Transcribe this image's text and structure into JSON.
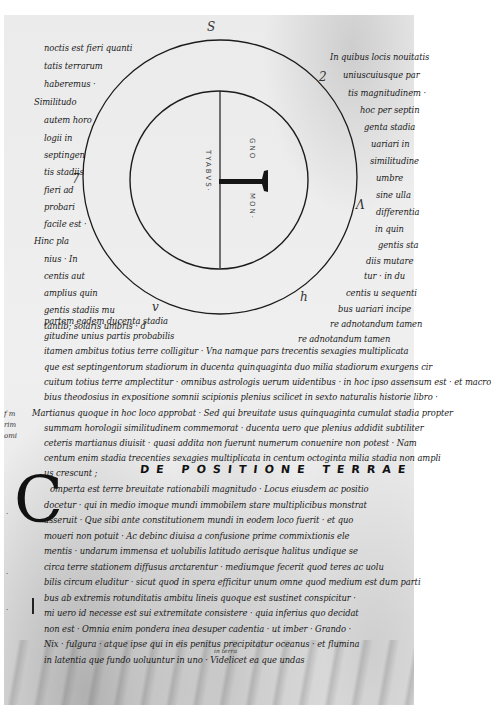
{
  "document": {
    "type": "medieval manuscript leaf",
    "subject": "De positione terrae",
    "colors": {
      "parchment": "#ececec",
      "ink": "#1a1a1a",
      "margin": "#ffffff"
    }
  },
  "diagram": {
    "outer_circle": {
      "cx": 220,
      "cy": 177,
      "r": 137
    },
    "inner_circle": {
      "cx": 219,
      "cy": 180,
      "r": 89
    },
    "vertical_line": {
      "x": 220,
      "y1": 91,
      "y2": 268
    },
    "t_bar": {
      "x1": 220,
      "x2": 266,
      "y": 181
    },
    "labels": {
      "left_vertical": "TYABVS·",
      "right_upper": "GNO",
      "right_lower": "MON·"
    },
    "quadrant_marks": [
      "S",
      "2",
      "7",
      "Λ",
      "h",
      "v",
      "d"
    ]
  },
  "left_column": [
    "noctis est fieri quanti",
    "tatis terrarum",
    "haberemus ·",
    "Similitudo",
    "autem horo",
    "logii in",
    "septingen",
    "tis stadiis",
    "fieri ad",
    "probari",
    "facile est ·",
    "Hinc pla",
    "nius · In",
    "centis aut",
    "amplius quin",
    "gentis stadiis mu",
    "tantib; solaris umbris · d"
  ],
  "right_column": [
    "In quibus locis nouitatis",
    "uniuscuiusque par",
    "tis magnitudinem ·",
    "hoc per septin",
    "genta stadia",
    "uariari in",
    "similitudine",
    "umbre",
    "sine ulla",
    "differentia",
    "in quin",
    "gentis sta",
    "diis mutare",
    "tur · in du",
    "centis u sequenti",
    "bus uariari incipe",
    "re adnotandum tamen"
  ],
  "full_lines": [
    "partem eadem ducenta stadia",
    "gitudine unius partis probabilis",
    "itamen ambitus totius terre colligitur · Vna namque pars trecentis sexagies multiplicata",
    "que est septingentorum stadiorum in ducenta quinquaginta duo milia stadiorum exurgens cir",
    "cuitum totius terre amplectitur · omnibus astrologis uerum uidentibus · in hoc ipso assensum est · et macro",
    "bius theodosius in expositione somnii scipionis plenius scilicet in sexto naturalis historie libro ·",
    "Martianus quoque in hoc loco approbat · Sed qui breuitate usus quinquaginta cumulat stadia propter",
    "summam horologii similitudinem commemorat · ducenta uero que plenius addidit subtiliter",
    "ceteris martianus diuisit · quasi addita non fuerunt   numerum conuenire non potest · Nam",
    "centum enim stadia trecenties sexagies multiplicata in centum octoginta milia stadia non ampli",
    "us crescunt ;",
    "omperta est terre breuitate rationabili magnitudo · Locus eiusdem ac positio",
    "docetur · qui in medio imoque mundi immobilem stare multiplicibus monstrat",
    "asseruit · Que sibi ante constitutionem mundi in eodem loco fuerit · et quo",
    "moueri non potuit · Ac debinc diuisa a confusione prime commixtionis ele",
    "mentis · undarum immensa et uolubilis latitudo aerisque halitus undique se",
    "circa terre stationem diffusus arctarentur · mediumque fecerit quod teres ac uolu",
    "bilis circum eluditur · sicut quod in spera efficitur unum omne quod medium est dum parti",
    "bus ab extremis rotunditatis ambitu lineis quoque est sustinet conspicitur ·",
    "mi uero id necesse est sui extremitate consistere · quia inferius quo decidat",
    "non est · Omnia enim pondera inea desuper cadentia · ut imber · Grando ·",
    "Nix · fulgura · atque ipse qui in eis penitus precipitatur oceanus · et flumina",
    "in latentia que fundo uoluuntur in uno · Videlicet ea que undas"
  ],
  "heading": "DE POSITIONE TERRAE",
  "initial_letter": "C",
  "left_margin_glosses": [
    "f m",
    "rim",
    "omi",
    "·",
    "·",
    "·"
  ],
  "interlinear_glosses": [
    "in terra",
    "s"
  ]
}
